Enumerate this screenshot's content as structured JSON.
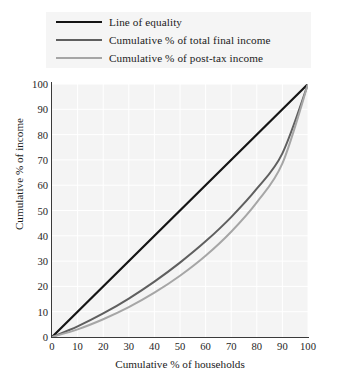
{
  "chart_data": {
    "type": "line",
    "title": "",
    "xlabel": "Cumulative % of households",
    "ylabel": "Cumulative % of income",
    "xlim": [
      0,
      100
    ],
    "ylim": [
      0,
      100
    ],
    "xticks": [
      0,
      10,
      20,
      30,
      40,
      50,
      60,
      70,
      80,
      90,
      100
    ],
    "yticks": [
      0,
      10,
      20,
      30,
      40,
      50,
      60,
      70,
      80,
      90,
      100
    ],
    "grid": true,
    "legend_position": "top",
    "x": [
      0,
      10,
      20,
      30,
      40,
      50,
      60,
      70,
      80,
      90,
      100
    ],
    "series": [
      {
        "name": "Line of equality",
        "color": "#151515",
        "width": 2.2,
        "values": [
          0,
          10,
          20,
          30,
          40,
          50,
          60,
          70,
          80,
          90,
          100
        ]
      },
      {
        "name": "Cumulative % of total final income",
        "color": "#5f5f5f",
        "width": 2.0,
        "values": [
          0,
          4.2,
          9.3,
          15.2,
          21.9,
          29.4,
          37.8,
          47.4,
          58.6,
          72.6,
          100
        ]
      },
      {
        "name": "Cumulative % of post-tax income",
        "color": "#a6a6a6",
        "width": 2.0,
        "values": [
          0,
          3.0,
          7.0,
          11.8,
          17.5,
          24.2,
          32.1,
          41.6,
          53.2,
          68.6,
          100
        ]
      }
    ]
  },
  "legend": {
    "items": [
      {
        "label": "Line of equality"
      },
      {
        "label": "Cumulative % of total final income"
      },
      {
        "label": "Cumulative % of post-tax income"
      }
    ]
  },
  "colors": {
    "plot_background": "#f4f4f4",
    "legend_background": "#f5f5f5",
    "axis": "#3a3a3a",
    "gridline": "#ffffff",
    "text": "#1b1b1b"
  }
}
